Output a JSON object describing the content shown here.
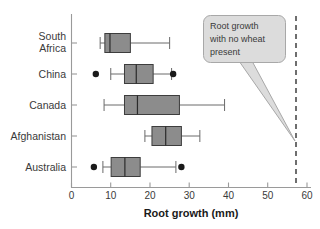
{
  "chart_data": {
    "type": "box",
    "title": "",
    "xlabel": "Root growth (mm)",
    "ylabel": "",
    "xlim": [
      0,
      60
    ],
    "xticks": [
      0,
      10,
      20,
      30,
      40,
      50,
      60
    ],
    "xtick_labels": [
      "0",
      "10",
      "20",
      "30",
      "40",
      "50",
      "60"
    ],
    "grid": false,
    "orientation": "horizontal",
    "categories": [
      "South Africa",
      "China",
      "Canada",
      "Afghanistan",
      "Australia"
    ],
    "boxes": [
      {
        "category": "South Africa",
        "whisker_low": 7.3,
        "q1": 8.5,
        "median": 9.8,
        "q3": 15.0,
        "whisker_high": 25.0,
        "outliers": []
      },
      {
        "category": "China",
        "whisker_low": 10.0,
        "q1": 13.5,
        "median": 16.5,
        "q3": 20.8,
        "whisker_high": 25.5,
        "outliers": [
          6.2,
          25.9
        ]
      },
      {
        "category": "Canada",
        "whisker_low": 8.3,
        "q1": 13.5,
        "median": 16.8,
        "q3": 27.5,
        "whisker_high": 39.0,
        "outliers": []
      },
      {
        "category": "Afghanistan",
        "whisker_low": 18.7,
        "q1": 20.5,
        "median": 24.0,
        "q3": 28.0,
        "whisker_high": 32.7,
        "outliers": []
      },
      {
        "category": "Australia",
        "whisker_low": 8.0,
        "q1": 10.1,
        "median": 13.6,
        "q3": 17.5,
        "whisker_high": 26.6,
        "outliers": [
          5.7,
          28.0
        ]
      }
    ],
    "reference_line": {
      "value": 57.2,
      "style": "dashed",
      "annotation": "Root growth with no wheat present"
    },
    "annotations": [
      {
        "name": "callout",
        "lines": [
          "Root growth",
          "with no wheat",
          "present"
        ],
        "points_to": 57.2
      }
    ],
    "colors": {
      "box_fill": "#8c8c8c",
      "box_edge": "#3d3d3d",
      "median": "#2b2b2b",
      "whisker": "#6a6a6a",
      "outlier": "#1a1a1a",
      "reference_line": "#6e6e6e",
      "callout_fill": "#dcdcdc",
      "callout_edge": "#a8a8a8",
      "axis": "#9a9a9a",
      "background": "#ffffff"
    }
  }
}
